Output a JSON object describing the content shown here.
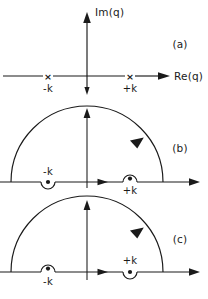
{
  "figure": {
    "width": 208,
    "height": 299,
    "background": "#ffffff",
    "ink": "#1a1a1a"
  },
  "axes": {
    "imaginary_label": "Im(q)",
    "real_label": "Re(q)",
    "origin_x": 87,
    "pole_minus_x": 48,
    "pole_plus_x": 130
  },
  "labels": {
    "minus_k": "-k",
    "plus_k": "+k",
    "pole_marker": "×"
  },
  "panels": [
    {
      "id": "a",
      "label": "(a)",
      "caption_x": 180,
      "caption_y": 48,
      "axis_y": 76,
      "description": "Real axis with crossed poles at -k and +k, imaginary axis drawn vertically",
      "poles": [
        {
          "name": "-k",
          "marker": "×",
          "x": 48,
          "label_position": "below"
        },
        {
          "name": "+k",
          "marker": "×",
          "x": 130,
          "label_position": "below"
        }
      ]
    },
    {
      "id": "b",
      "label": "(b)",
      "caption_x": 180,
      "caption_y": 152,
      "axis_y": 182,
      "radius": 76,
      "description": "Semicircular contour closed in upper half plane; indentation below axis at -k, above axis at +k",
      "poles": [
        {
          "name": "-k",
          "marker": "●",
          "x": 48,
          "indent": "below",
          "label_position": "above"
        },
        {
          "name": "+k",
          "marker": "●",
          "x": 130,
          "indent": "above",
          "label_position": "below"
        }
      ]
    },
    {
      "id": "c",
      "label": "(c)",
      "caption_x": 180,
      "caption_y": 243,
      "axis_y": 272,
      "radius": 76,
      "description": "Semicircular contour closed in upper half plane; indentation above axis at -k, below axis at +k",
      "poles": [
        {
          "name": "-k",
          "marker": "●",
          "x": 48,
          "indent": "above",
          "label_position": "below"
        },
        {
          "name": "+k",
          "marker": "●",
          "x": 130,
          "indent": "below",
          "label_position": "above"
        }
      ]
    }
  ]
}
